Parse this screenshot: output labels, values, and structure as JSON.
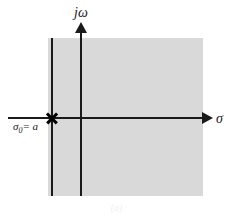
{
  "figure": {
    "caption": "(a)"
  },
  "axes": {
    "vertical_label": "jω",
    "horizontal_label": "σ"
  },
  "markers": {
    "pole_label_symbol": "σ",
    "pole_label_subscript": "0",
    "pole_label_value": "= a",
    "pole_label_full": "σ₀ = a"
  },
  "colors": {
    "shade": "#d9d9d9",
    "line": "#1a1a1a",
    "background": "#ffffff"
  },
  "chart_data": {
    "type": "scatter",
    "xlabel": "σ",
    "ylabel": "jω",
    "grid": false,
    "legend": "none",
    "annotations": [
      "σ₀ = a"
    ],
    "poles": [
      {
        "label": "σ₀ = a",
        "sigma": "a",
        "omega": 0,
        "marker": "x"
      }
    ],
    "shaded_regions": [
      {
        "name": "region-of-convergence",
        "description": "Re{s} > a",
        "color": "#d9d9d9",
        "boundary": "vertical line at σ = a"
      }
    ]
  }
}
